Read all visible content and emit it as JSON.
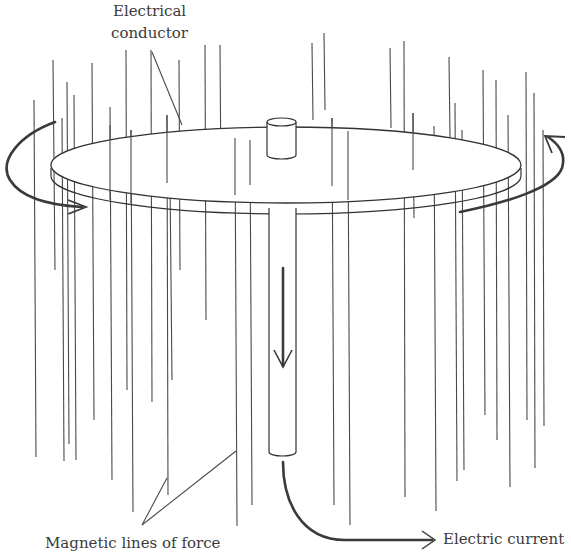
{
  "diagram": {
    "type": "homopolar-generator",
    "labels": {
      "conductor": [
        "Electrical",
        "conductor"
      ],
      "magnetic": "Magnetic lines of force",
      "current": "Electric current"
    },
    "colors": {
      "line": "#4a4a4a",
      "arrow": "#3a3a3a",
      "background": "#ffffff"
    }
  }
}
